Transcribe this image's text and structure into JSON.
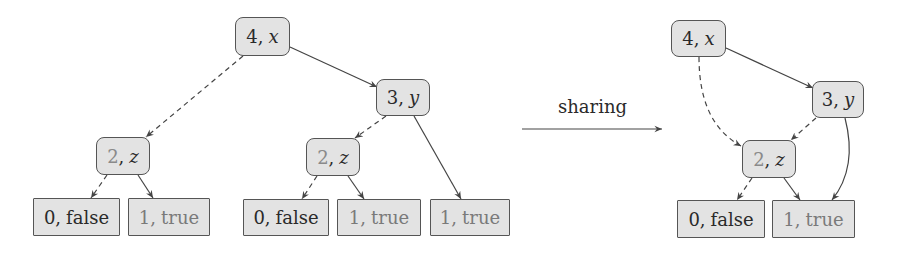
{
  "diagram": {
    "title": "",
    "transform_label": "sharing",
    "colors": {
      "node_fill": "#e3e3e3",
      "node_border": "#555555",
      "edge": "#444444",
      "text_dark": "#2a2a2a",
      "text_grey": "#7a7a7a"
    },
    "left_tree": {
      "nodes": [
        {
          "id": "L-4x",
          "num": "4",
          "var": "x",
          "kind": "inner"
        },
        {
          "id": "L-3y",
          "num": "3",
          "var": "y",
          "kind": "inner"
        },
        {
          "id": "L-2z-a",
          "num": "2",
          "var": "z",
          "kind": "inner"
        },
        {
          "id": "L-2z-b",
          "num": "2",
          "var": "z",
          "kind": "inner"
        },
        {
          "id": "L-0f-a",
          "num": "0",
          "value": "false",
          "kind": "leaf"
        },
        {
          "id": "L-1t-a",
          "num": "1",
          "value": "true",
          "kind": "leaf"
        },
        {
          "id": "L-0f-b",
          "num": "0",
          "value": "false",
          "kind": "leaf"
        },
        {
          "id": "L-1t-b",
          "num": "1",
          "value": "true",
          "kind": "leaf"
        },
        {
          "id": "L-1t-c",
          "num": "1",
          "value": "true",
          "kind": "leaf"
        }
      ],
      "edges": [
        {
          "from": "L-4x",
          "to": "L-2z-a",
          "style": "dashed"
        },
        {
          "from": "L-4x",
          "to": "L-3y",
          "style": "solid"
        },
        {
          "from": "L-3y",
          "to": "L-2z-b",
          "style": "dashed"
        },
        {
          "from": "L-3y",
          "to": "L-1t-c",
          "style": "solid"
        },
        {
          "from": "L-2z-a",
          "to": "L-0f-a",
          "style": "dashed"
        },
        {
          "from": "L-2z-a",
          "to": "L-1t-a",
          "style": "solid"
        },
        {
          "from": "L-2z-b",
          "to": "L-0f-b",
          "style": "dashed"
        },
        {
          "from": "L-2z-b",
          "to": "L-1t-b",
          "style": "solid"
        }
      ]
    },
    "right_tree": {
      "nodes": [
        {
          "id": "R-4x",
          "num": "4",
          "var": "x",
          "kind": "inner"
        },
        {
          "id": "R-3y",
          "num": "3",
          "var": "y",
          "kind": "inner"
        },
        {
          "id": "R-2z",
          "num": "2",
          "var": "z",
          "kind": "inner"
        },
        {
          "id": "R-0f",
          "num": "0",
          "value": "false",
          "kind": "leaf"
        },
        {
          "id": "R-1t",
          "num": "1",
          "value": "true",
          "kind": "leaf"
        }
      ],
      "edges": [
        {
          "from": "R-4x",
          "to": "R-2z",
          "style": "dashed"
        },
        {
          "from": "R-4x",
          "to": "R-3y",
          "style": "solid"
        },
        {
          "from": "R-3y",
          "to": "R-2z",
          "style": "dashed"
        },
        {
          "from": "R-3y",
          "to": "R-1t",
          "style": "solid"
        },
        {
          "from": "R-2z",
          "to": "R-0f",
          "style": "dashed"
        },
        {
          "from": "R-2z",
          "to": "R-1t",
          "style": "solid"
        }
      ]
    }
  },
  "text": {
    "sep": ","
  }
}
